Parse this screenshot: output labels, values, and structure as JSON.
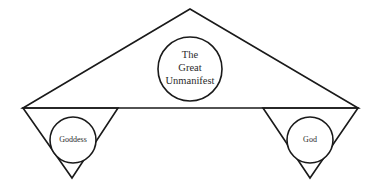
{
  "figure": {
    "background_color": "#ffffff",
    "line_color": "#1a1a1a",
    "text_color": "#2b2b2b",
    "shapes": {
      "upward_triangle": {
        "name": "upward-triangle",
        "points": "190,9 358,108 23,108"
      },
      "left_downward_triangle": {
        "name": "left-downward-triangle",
        "points": "23,108 118,108 72,178"
      },
      "right_downward_triangle": {
        "name": "right-downward-triangle",
        "points": "263,108 358,108 310,178"
      },
      "horizontal_line": {
        "name": "horizontal-base-line",
        "x1": 23,
        "y1": 108,
        "x2": 358,
        "y2": 108
      }
    },
    "circles": {
      "center": {
        "name": "center-circle",
        "cx": 190,
        "cy": 69,
        "r": 32,
        "lines": [
          "The",
          "Great",
          "Unmanifest"
        ],
        "line_y": [
          56,
          69,
          82
        ]
      },
      "left": {
        "name": "left-circle",
        "cx": 73,
        "cy": 140,
        "r": 23,
        "label": "Goddess"
      },
      "right": {
        "name": "right-circle",
        "cx": 310,
        "cy": 140,
        "r": 23,
        "label": "God"
      }
    }
  }
}
